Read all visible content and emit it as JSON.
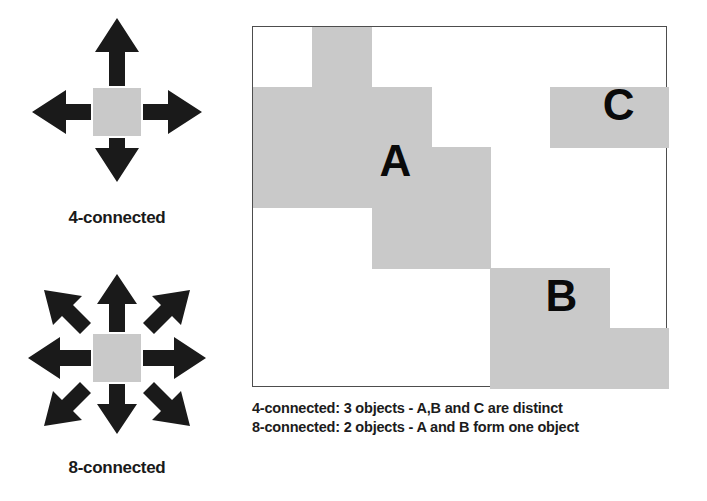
{
  "colors": {
    "pixel_gray": "#c9c9c9",
    "arrow_black": "#1a1a1a",
    "grid_border": "#4d4d4d",
    "text": "#1c1c1c",
    "background": "#ffffff"
  },
  "panels": [
    {
      "id": "4-connected",
      "label": "4-connected",
      "neighbor_count": 4,
      "directions": [
        "up",
        "right",
        "down",
        "left"
      ],
      "center_pixel_color": "#c9c9c9"
    },
    {
      "id": "8-connected",
      "label": "8-connected",
      "neighbor_count": 8,
      "directions": [
        "up",
        "up-right",
        "right",
        "down-right",
        "down",
        "down-left",
        "left",
        "up-left"
      ],
      "center_pixel_color": "#c9c9c9"
    }
  ],
  "grid": {
    "columns": 7,
    "rows": 6,
    "cell_width": 59.3,
    "cell_height": 60.2,
    "border_color": "#4d4d4d",
    "filled_color": "#c9c9c9",
    "empty_color": "#ffffff",
    "occupancy": [
      [
        0,
        1,
        0,
        0,
        0,
        0,
        0
      ],
      [
        1,
        1,
        1,
        0,
        0,
        1,
        1
      ],
      [
        1,
        1,
        1,
        1,
        0,
        0,
        0
      ],
      [
        0,
        0,
        1,
        1,
        0,
        0,
        0
      ],
      [
        0,
        0,
        0,
        0,
        1,
        1,
        0
      ],
      [
        0,
        0,
        0,
        0,
        1,
        1,
        1
      ]
    ],
    "region_labels": [
      {
        "text": "A",
        "col": 2,
        "row": 2,
        "offset_x": 8,
        "offset_y": -8
      },
      {
        "text": "B",
        "col": 5,
        "row": 4,
        "offset_x": -4,
        "offset_y": 6
      },
      {
        "text": "C",
        "col": 6,
        "row": 1,
        "offset_x": -6,
        "offset_y": -4
      }
    ]
  },
  "caption": {
    "line1": "4-connected: 3 objects - A,B and C are distinct",
    "line2": "8-connected: 2 objects - A and B form one object"
  }
}
